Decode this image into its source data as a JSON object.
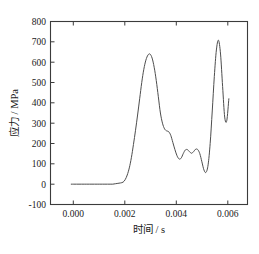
{
  "chart_data": {
    "type": "line",
    "title": "",
    "xlabel": "时间 / s",
    "ylabel": "应力 / MPa",
    "xlim": [
      -0.0008,
      0.0068
    ],
    "ylim": [
      -100,
      800
    ],
    "xticks": [
      0.0,
      0.002,
      0.004,
      0.006
    ],
    "xtick_labels": [
      "0.000",
      "0.002",
      "0.004",
      "0.006"
    ],
    "yticks": [
      -100,
      0,
      100,
      200,
      300,
      400,
      500,
      600,
      700,
      800
    ],
    "ytick_labels": [
      "-100",
      "0",
      "100",
      "200",
      "300",
      "400",
      "500",
      "600",
      "700",
      "800"
    ],
    "grid": false,
    "legend": null,
    "line_color": "#4d4d4d",
    "frame_color": "#3b3b3b",
    "background_color": "#ffffff",
    "series": [
      {
        "name": "应力",
        "x": [
          0.0,
          0.0001,
          0.0002,
          0.0003,
          0.0004,
          0.0005,
          0.0006,
          0.0007,
          0.0008,
          0.0009,
          0.001,
          0.0011,
          0.0012,
          0.0013,
          0.0014,
          0.0015,
          0.0016,
          0.0017,
          0.0018,
          0.0019,
          0.002,
          0.00208,
          0.00216,
          0.00224,
          0.00232,
          0.0024,
          0.00248,
          0.00256,
          0.00264,
          0.00272,
          0.0028,
          0.00288,
          0.00296,
          0.00304,
          0.00312,
          0.0032,
          0.00328,
          0.00336,
          0.00344,
          0.00352,
          0.0036,
          0.00368,
          0.00376,
          0.00384,
          0.00392,
          0.004,
          0.00408,
          0.00416,
          0.00424,
          0.00432,
          0.0044,
          0.00448,
          0.00456,
          0.00464,
          0.00472,
          0.0048,
          0.00488,
          0.00496,
          0.00504,
          0.00512,
          0.0052,
          0.00528,
          0.00536,
          0.00544,
          0.00552,
          0.0056,
          0.00568,
          0.00576,
          0.00584,
          0.00592,
          0.006,
          0.00608
        ],
        "y": [
          0,
          0,
          0,
          0,
          0,
          0,
          0,
          0,
          0,
          0,
          0,
          0,
          0,
          0,
          0,
          0,
          0,
          2,
          4,
          6,
          10,
          22,
          45,
          80,
          130,
          195,
          265,
          340,
          420,
          500,
          565,
          610,
          635,
          640,
          620,
          575,
          510,
          430,
          350,
          300,
          272,
          262,
          258,
          240,
          205,
          170,
          140,
          124,
          128,
          150,
          168,
          170,
          160,
          152,
          160,
          172,
          170,
          150,
          110,
          70,
          58,
          95,
          200,
          360,
          530,
          660,
          708,
          640,
          480,
          330,
          312,
          420
        ]
      }
    ]
  },
  "axis": {
    "ylabel": "应力 / MPa",
    "xlabel": "时间 / s"
  }
}
